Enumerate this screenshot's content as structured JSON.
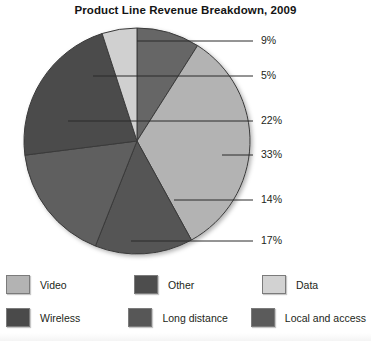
{
  "chart_data": {
    "type": "pie",
    "title": "Product Line Revenue Breakdown, 2009",
    "xlabel": "",
    "ylabel": "",
    "legend_position": "bottom",
    "grid": false,
    "start_angle_deg": 0,
    "direction": "clockwise",
    "categories": [
      "Video",
      "Other",
      "Data",
      "Wireless",
      "Long distance",
      "Local and access"
    ],
    "slices": [
      {
        "label": "Other",
        "value": 9,
        "pct_text": "9%",
        "color": "#666666",
        "start_deg": 0,
        "end_deg": 32.4,
        "leader_y": 41,
        "leader_x1": 137,
        "leader_x2": 253
      },
      {
        "label": "Data",
        "value": 33,
        "pct_text": "33%",
        "color": "#b3b3b3",
        "start_deg": 32.4,
        "end_deg": 151.2,
        "leader_y": 155,
        "leader_x1": 222,
        "leader_x2": 253
      },
      {
        "label": "Local and access",
        "value": 14,
        "pct_text": "14%",
        "color": "#555555",
        "start_deg": 151.2,
        "end_deg": 201.6,
        "leader_y": 200,
        "leader_x1": 174,
        "leader_x2": 253
      },
      {
        "label": "Long distance",
        "value": 17,
        "pct_text": "17%",
        "color": "#5e5e5e",
        "start_deg": 201.6,
        "end_deg": 262.8,
        "leader_y": 241,
        "leader_x1": 131,
        "leader_x2": 253
      },
      {
        "label": "Wireless",
        "value": 22,
        "pct_text": "22%",
        "color": "#4b4b4b",
        "start_deg": 262.8,
        "end_deg": 342.0,
        "leader_y": 121,
        "leader_x1": 68,
        "leader_x2": 253
      },
      {
        "label": "Video",
        "value": 5,
        "pct_text": "5%",
        "color": "#d0d0d0",
        "start_deg": 342.0,
        "end_deg": 360,
        "leader_y": 76,
        "leader_x1": 93,
        "leader_x2": 253
      }
    ],
    "percent_labels": [
      "9%",
      "5%",
      "22%",
      "33%",
      "14%",
      "17%"
    ],
    "geometry": {
      "cx": 137,
      "cy": 141,
      "r": 113
    }
  },
  "legend": {
    "rows": [
      [
        {
          "label": "Video",
          "color": "#b3b3b3"
        },
        {
          "label": "Other",
          "color": "#4d4d4d"
        },
        {
          "label": "Data",
          "color": "#d2d2d2"
        }
      ],
      [
        {
          "label": "Wireless",
          "color": "#4a4a4a"
        },
        {
          "label": "Long distance",
          "color": "#575757"
        },
        {
          "label": "Local and access",
          "color": "#5b5b5b"
        }
      ]
    ]
  },
  "colors": {
    "text": "#231f20",
    "title": "#141414",
    "pie_outline": "#3a3a3a",
    "leader_line": "#2b2b2b",
    "background": "#ffffff"
  }
}
